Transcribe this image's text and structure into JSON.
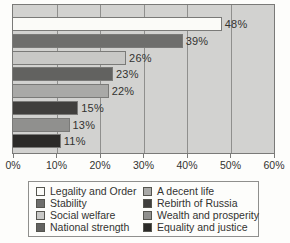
{
  "chart_data": {
    "type": "bar",
    "orientation": "horizontal",
    "title": "",
    "xlabel": "",
    "ylabel": "",
    "xlim": [
      0,
      60
    ],
    "x_tick_values": [
      0,
      10,
      20,
      30,
      40,
      50,
      60
    ],
    "x_tick_labels": [
      "0%",
      "10%",
      "20%",
      "30%",
      "40%",
      "50%",
      "60%"
    ],
    "grid": true,
    "legend_position": "bottom",
    "categories": [
      "Legality and Order",
      "Stability",
      "Social welfare",
      "National strength",
      "A decent life",
      "Rebirth of Russia",
      "Wealth and prosperity",
      "Equality and justice"
    ],
    "values": [
      48,
      39,
      26,
      23,
      22,
      15,
      13,
      11
    ],
    "value_labels": [
      "48%",
      "39%",
      "26%",
      "23%",
      "22%",
      "15%",
      "13%",
      "11%"
    ],
    "bar_colors": [
      "#fbfbf8",
      "#6e6e6c",
      "#c8c8c6",
      "#626260",
      "#a9a9a7",
      "#403f3d",
      "#90908e",
      "#2b2a28"
    ]
  },
  "colors": {
    "page_bg": "#fdfdfb",
    "plot_bg": "#d2d2d0",
    "grid_line": "#8f8f8d",
    "plot_border": "#7a7a78",
    "text": "#333331"
  }
}
